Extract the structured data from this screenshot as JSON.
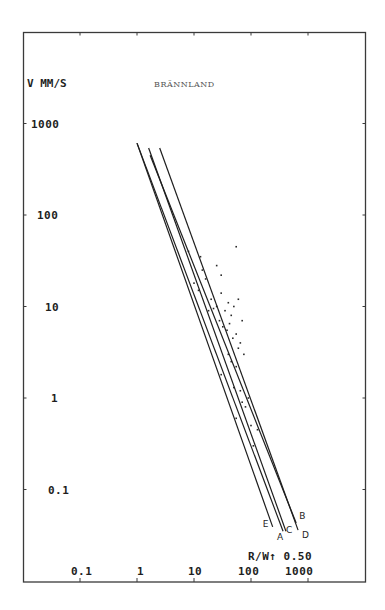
{
  "chart_data": {
    "type": "line",
    "title": "BRÄNNLAND",
    "ylabel": "V MM/S",
    "xlabel": "R/W↑ 0.50",
    "x_scale": "log",
    "y_scale": "log",
    "x_ticks": [
      "0.1",
      "1",
      "10",
      "100",
      "1000"
    ],
    "y_ticks": [
      "1000",
      "100",
      "10",
      "1",
      "0.1"
    ],
    "xlim": [
      0.02,
      1000
    ],
    "ylim": [
      0.02,
      3000
    ],
    "grid": false,
    "legend": "inline line labels at lower-right ends",
    "series": [
      {
        "name": "A",
        "x": [
          1.0,
          365
        ],
        "y": [
          610,
          0.035
        ]
      },
      {
        "name": "B",
        "x": [
          1.7,
          620
        ],
        "y": [
          450,
          0.043
        ]
      },
      {
        "name": "C",
        "x": [
          1.6,
          410
        ],
        "y": [
          540,
          0.035
        ]
      },
      {
        "name": "D",
        "x": [
          2.5,
          670
        ],
        "y": [
          540,
          0.036
        ]
      },
      {
        "name": "E",
        "x": [
          1.0,
          240
        ],
        "y": [
          610,
          0.039
        ]
      }
    ],
    "scatter_points": [
      [
        8,
        40
      ],
      [
        13,
        35
      ],
      [
        14,
        25
      ],
      [
        10,
        18
      ],
      [
        12,
        15
      ],
      [
        16,
        20
      ],
      [
        25,
        28
      ],
      [
        30,
        22
      ],
      [
        55,
        45
      ],
      [
        20,
        12
      ],
      [
        25,
        10
      ],
      [
        30,
        14
      ],
      [
        35,
        9
      ],
      [
        40,
        11
      ],
      [
        45,
        8
      ],
      [
        50,
        10
      ],
      [
        60,
        12
      ],
      [
        70,
        7
      ],
      [
        18,
        9
      ],
      [
        22,
        9.5
      ],
      [
        28,
        7
      ],
      [
        32,
        6
      ],
      [
        38,
        5.5
      ],
      [
        42,
        6.5
      ],
      [
        48,
        4.5
      ],
      [
        55,
        5
      ],
      [
        65,
        4
      ],
      [
        40,
        3
      ],
      [
        45,
        2.5
      ],
      [
        55,
        2.2
      ],
      [
        60,
        3.5
      ],
      [
        75,
        3
      ],
      [
        30,
        1.8
      ],
      [
        50,
        1.3
      ],
      [
        65,
        1.2
      ],
      [
        70,
        0.9
      ],
      [
        80,
        0.8
      ],
      [
        55,
        0.6
      ],
      [
        90,
        1.0
      ],
      [
        100,
        0.5
      ],
      [
        130,
        0.45
      ],
      [
        110,
        0.3
      ]
    ]
  },
  "labels": {
    "title": "BRÄNNLAND",
    "y_axis": "V MM/S",
    "x_axis": "R/W↑ 0.50",
    "x_ticks": [
      "0.1",
      "1",
      "10",
      "100",
      "1000"
    ],
    "y_ticks": [
      "1000",
      "100",
      "10",
      "1",
      "0.1"
    ],
    "line_names": [
      "A",
      "B",
      "C",
      "D",
      "E"
    ]
  }
}
